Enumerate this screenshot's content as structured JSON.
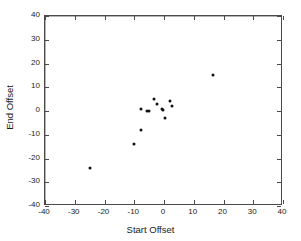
{
  "chart_data": {
    "type": "scatter",
    "title": "",
    "xlabel": "Start Offset",
    "ylabel": "End Offset",
    "xlim": [
      -40,
      40
    ],
    "ylim": [
      -40,
      40
    ],
    "xticks": [
      -40,
      -30,
      -20,
      -10,
      0,
      10,
      20,
      30,
      40
    ],
    "yticks": [
      -40,
      -30,
      -20,
      -10,
      0,
      10,
      20,
      30,
      40
    ],
    "xtick_labels": [
      "-40",
      "-30",
      "-20",
      "-10",
      "0",
      "10",
      "20",
      "30",
      "40"
    ],
    "ytick_labels": [
      "-40",
      "-30",
      "-20",
      "-10",
      "0",
      "10",
      "20",
      "30",
      "40"
    ],
    "grid": false,
    "zero_lines": true,
    "legend": null,
    "marker": "filled-circle",
    "marker_color": "#111111",
    "points": [
      {
        "x": -25.0,
        "y": -23.8
      },
      {
        "x": -10.2,
        "y": -13.7
      },
      {
        "x": -7.6,
        "y": -7.8
      },
      {
        "x": -7.8,
        "y": 0.9
      },
      {
        "x": -5.8,
        "y": 0.0
      },
      {
        "x": -5.0,
        "y": 0.1
      },
      {
        "x": -3.4,
        "y": 5.1
      },
      {
        "x": -2.2,
        "y": 3.1
      },
      {
        "x": -0.6,
        "y": 1.0
      },
      {
        "x": -0.2,
        "y": 0.3
      },
      {
        "x": 0.2,
        "y": -2.9
      },
      {
        "x": 1.9,
        "y": 4.1
      },
      {
        "x": 2.6,
        "y": 2.2
      },
      {
        "x": 16.5,
        "y": 15.2
      }
    ]
  },
  "colors": {
    "axis": "#4a4a4a",
    "zero_line": "#b4b4b4",
    "marker": "#111111",
    "text": "#1a1a1a",
    "background": "#ffffff"
  }
}
